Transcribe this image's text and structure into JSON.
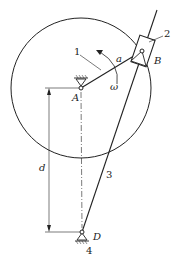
{
  "diagram": {
    "type": "mechanism-kinematic-diagram",
    "labels": {
      "link1": "1",
      "slider2": "2",
      "link3": "3",
      "frame4": "4",
      "pointA": "A",
      "pointB": "B",
      "pointD": "D",
      "crank_length": "a",
      "angular_velocity": "ω",
      "distance": "d"
    },
    "colors": {
      "stroke": "#222222",
      "background": "#ffffff"
    }
  }
}
